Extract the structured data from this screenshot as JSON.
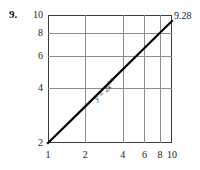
{
  "problem": {
    "number": "9."
  },
  "chart_data": {
    "type": "line",
    "title": "",
    "xlabel": "",
    "ylabel": "",
    "xscale": "log",
    "yscale": "log",
    "grid": true,
    "legend": null,
    "xlim": [
      1,
      10
    ],
    "ylim": [
      2,
      10
    ],
    "xticks": [
      1,
      2,
      4,
      6,
      8,
      10
    ],
    "xtick_labels": [
      "1",
      "2",
      "4",
      "6",
      "8",
      "10"
    ],
    "yticks": [
      2,
      4,
      6,
      8,
      10
    ],
    "ytick_labels": [
      "2",
      "4",
      "6",
      "8",
      "10"
    ],
    "series": [
      {
        "name": "y = 2x^(2/3)",
        "equation_display": "y = 2x",
        "equation_exponent": "2/3",
        "x": [
          1,
          2,
          4,
          6,
          8,
          10
        ],
        "y": [
          2,
          3.17,
          5.04,
          6.6,
          8.0,
          9.28
        ],
        "color": "#000000",
        "linewidth": 2.2
      }
    ],
    "annotations": [
      {
        "name": "endpoint-value",
        "text": "9.28",
        "x": 10,
        "y": 9.28
      },
      {
        "name": "curve-equation",
        "text": "y = 2x",
        "exponent": "2/3"
      }
    ]
  }
}
